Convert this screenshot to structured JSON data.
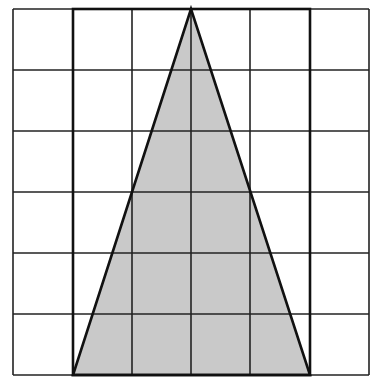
{
  "diagram": {
    "type": "grid-with-triangle",
    "grid": {
      "columns": 6,
      "rows": 6,
      "x_lines": [
        13,
        73,
        132,
        191,
        250,
        310,
        369
      ],
      "y_lines": [
        9,
        70,
        131,
        192,
        253,
        314,
        375
      ],
      "line_color": "#222222"
    },
    "rectangle": {
      "x1": 73,
      "y1": 9,
      "x2": 310,
      "y2": 375,
      "stroke": "#111111"
    },
    "triangle": {
      "points": [
        [
          191,
          9
        ],
        [
          73,
          375
        ],
        [
          310,
          375
        ]
      ],
      "fill": "#c9c9c9",
      "stroke": "#111111"
    }
  }
}
